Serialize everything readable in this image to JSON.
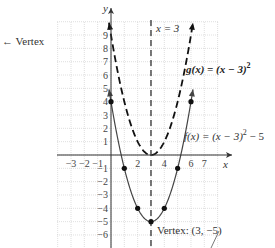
{
  "chart_data": {
    "type": "line",
    "title": "",
    "xlabel": "x",
    "ylabel": "y",
    "xlim": [
      -4,
      8
    ],
    "ylim": [
      -7,
      10
    ],
    "grid": true,
    "x_ticks": [
      -3,
      -2,
      -1,
      2,
      4,
      6,
      7
    ],
    "x_tick_labels": [
      "−3",
      "−2",
      "−1",
      "2",
      "4",
      "6",
      "7"
    ],
    "y_ticks": [
      9,
      8,
      7,
      6,
      5,
      4,
      3,
      2,
      1,
      -1,
      -2,
      -3,
      -4,
      -5,
      -6
    ],
    "y_tick_labels": [
      "9",
      "8",
      "7",
      "6",
      "5",
      "4",
      "3",
      "2",
      "1",
      "−1",
      "−2",
      "−3",
      "−4",
      "−5",
      "−6"
    ],
    "series": [
      {
        "name": "g(x) = (x − 3)²",
        "style": "dashed",
        "formula": "(x-3)^2",
        "x_range": [
          -0.15,
          6.15
        ]
      },
      {
        "name": "f(x) = (x − 3)² − 5",
        "style": "solid",
        "formula": "(x-3)^2-5",
        "x_range": [
          -0.15,
          6.15
        ],
        "points": [
          [
            0,
            4
          ],
          [
            1,
            -1
          ],
          [
            2,
            -4
          ],
          [
            3,
            -5
          ],
          [
            4,
            -4
          ],
          [
            5,
            -1
          ],
          [
            6,
            4
          ]
        ]
      }
    ],
    "axis_of_symmetry": {
      "label": "x = 3",
      "x": 3
    },
    "annotations": [
      {
        "text": "← Vertex",
        "position": "left-top"
      },
      {
        "text": "g(x) = (x − 3)²",
        "position": "right, near y=5"
      },
      {
        "text": "f(x) = (x − 3)² − 5",
        "position": "right, near y=1"
      },
      {
        "text": "Vertex: (3, −5)",
        "position": "below vertex"
      }
    ],
    "vertex": [
      3,
      -5
    ]
  },
  "labels": {
    "vertex_arrow": "← Vertex",
    "x_axis": "x",
    "y_axis": "y",
    "symmetry_line": "x = 3",
    "g_label": "g(x) = (x − 3)",
    "g_exp": "2",
    "f_label_pre": "f(x) = (x − 3)",
    "f_exp": "2",
    "f_label_post": " − 5",
    "vertex_label": "Vertex: (3, −5)"
  }
}
